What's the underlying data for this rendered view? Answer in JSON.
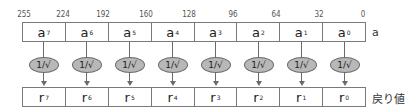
{
  "bit_labels": [
    {
      "text": "255",
      "x": 24
    },
    {
      "text": "224",
      "x": 63
    },
    {
      "text": "192",
      "x": 103
    },
    {
      "text": "160",
      "x": 146
    },
    {
      "text": "128",
      "x": 189
    },
    {
      "text": "96",
      "x": 233
    },
    {
      "text": "64",
      "x": 276
    },
    {
      "text": "32",
      "x": 319
    },
    {
      "text": "0",
      "x": 363
    }
  ],
  "input_row": {
    "label": "a",
    "cells": [
      {
        "base": "a",
        "sub": "7"
      },
      {
        "base": "a",
        "sub": "6"
      },
      {
        "base": "a",
        "sub": "5"
      },
      {
        "base": "a",
        "sub": "4"
      },
      {
        "base": "a",
        "sub": "3"
      },
      {
        "base": "a",
        "sub": "2"
      },
      {
        "base": "a",
        "sub": "1"
      },
      {
        "base": "a",
        "sub": "0"
      }
    ]
  },
  "operation": {
    "label": "1/√",
    "count": 8
  },
  "output_row": {
    "label": "戻り値",
    "cells": [
      {
        "base": "r",
        "sub": "7"
      },
      {
        "base": "r",
        "sub": "6"
      },
      {
        "base": "r",
        "sub": "5"
      },
      {
        "base": "r",
        "sub": "4"
      },
      {
        "base": "r",
        "sub": "3"
      },
      {
        "base": "r",
        "sub": "2"
      },
      {
        "base": "r",
        "sub": "1"
      },
      {
        "base": "r",
        "sub": "0"
      }
    ]
  },
  "colors": {
    "ellipse_fill": "#b8b8b8",
    "stroke": "#6a6a6a"
  }
}
